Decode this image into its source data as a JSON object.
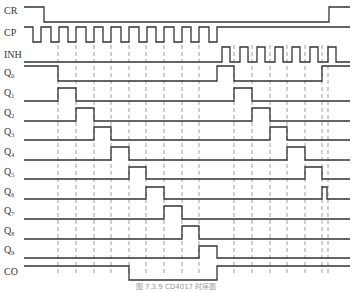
{
  "caption": "图 7.3.9  CD4017 时序图",
  "x_start": 24,
  "x_end": 350,
  "dashed_lines": [
    58,
    76,
    94,
    111,
    129,
    146,
    164,
    182,
    199,
    234,
    252,
    270,
    287,
    305,
    322,
    328
  ],
  "dash_top": 45,
  "dash_bottom": 274,
  "signals": [
    {
      "name": "CR",
      "sub": "",
      "label_y": 14,
      "high": 7,
      "low": 22,
      "edges": [
        [
          24,
          1
        ],
        [
          44,
          0
        ],
        [
          329,
          1
        ]
      ]
    },
    {
      "name": "CP",
      "sub": "",
      "label_y": 36,
      "high": 27,
      "low": 42,
      "edges": "CP"
    },
    {
      "name": "INH",
      "sub": "",
      "label_y": 58,
      "high": 47,
      "low": 62,
      "edges": "INH"
    },
    {
      "name": "Q",
      "sub": "0",
      "label_y": 76,
      "high": 66,
      "low": 81,
      "edges": [
        [
          24,
          1
        ],
        [
          58,
          0
        ],
        [
          217,
          1
        ],
        [
          234,
          0
        ],
        [
          322,
          1
        ]
      ]
    },
    {
      "name": "Q",
      "sub": "1",
      "label_y": 96,
      "high": 88,
      "low": 101,
      "edges": [
        [
          24,
          0
        ],
        [
          58,
          1
        ],
        [
          76,
          0
        ],
        [
          234,
          1
        ],
        [
          252,
          0
        ]
      ]
    },
    {
      "name": "Q",
      "sub": "2",
      "label_y": 116,
      "high": 108,
      "low": 121,
      "edges": [
        [
          24,
          0
        ],
        [
          76,
          1
        ],
        [
          94,
          0
        ],
        [
          252,
          1
        ],
        [
          270,
          0
        ]
      ]
    },
    {
      "name": "Q",
      "sub": "3",
      "label_y": 135,
      "high": 127,
      "low": 140,
      "edges": [
        [
          24,
          0
        ],
        [
          94,
          1
        ],
        [
          111,
          0
        ],
        [
          270,
          1
        ],
        [
          287,
          0
        ]
      ]
    },
    {
      "name": "Q",
      "sub": "4",
      "label_y": 155,
      "high": 147,
      "low": 160,
      "edges": [
        [
          24,
          0
        ],
        [
          111,
          1
        ],
        [
          129,
          0
        ],
        [
          287,
          1
        ],
        [
          305,
          0
        ]
      ]
    },
    {
      "name": "Q",
      "sub": "5",
      "label_y": 175,
      "high": 167,
      "low": 179,
      "edges": [
        [
          24,
          0
        ],
        [
          129,
          1
        ],
        [
          146,
          0
        ],
        [
          305,
          1
        ],
        [
          322,
          0
        ]
      ]
    },
    {
      "name": "Q",
      "sub": "6",
      "label_y": 195,
      "high": 187,
      "low": 199,
      "edges": [
        [
          24,
          0
        ],
        [
          146,
          1
        ],
        [
          164,
          0
        ],
        [
          322,
          1
        ],
        [
          327,
          0
        ]
      ]
    },
    {
      "name": "Q",
      "sub": "7",
      "label_y": 214,
      "high": 206,
      "low": 219,
      "edges": [
        [
          24,
          0
        ],
        [
          164,
          1
        ],
        [
          182,
          0
        ]
      ]
    },
    {
      "name": "Q",
      "sub": "8",
      "label_y": 234,
      "high": 226,
      "low": 239,
      "edges": [
        [
          24,
          0
        ],
        [
          182,
          1
        ],
        [
          199,
          0
        ]
      ]
    },
    {
      "name": "Q",
      "sub": "9",
      "label_y": 253,
      "high": 246,
      "low": 258,
      "edges": [
        [
          24,
          0
        ],
        [
          199,
          1
        ],
        [
          217,
          0
        ]
      ]
    },
    {
      "name": "CO",
      "sub": "",
      "label_y": 275,
      "high": 266,
      "low": 280,
      "edges": [
        [
          24,
          1
        ],
        [
          129,
          0
        ],
        [
          217,
          1
        ]
      ]
    }
  ],
  "cp": {
    "start_x": 24,
    "first_fall": 33,
    "period": 17.6,
    "low_width": 8,
    "pulses": 11,
    "end_high_x": 217
  },
  "inh": {
    "start_x": 24,
    "first_rise": 222,
    "period": 17.6,
    "high_width": 8,
    "pulses": 7
  }
}
